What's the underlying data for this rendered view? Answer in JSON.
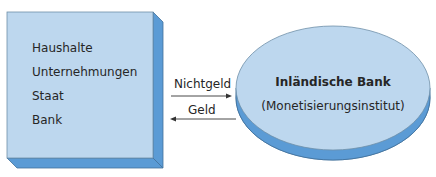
{
  "diagram": {
    "left_box": {
      "items": [
        "Haushalte",
        "Unternehmungen",
        "Staat",
        "Bank"
      ]
    },
    "arrows": [
      {
        "label": "Nichtgeld",
        "direction": "right"
      },
      {
        "label": "Geld",
        "direction": "left"
      }
    ],
    "right_ellipse": {
      "title": "Inländische Bank",
      "subtitle": "(Monetisierungsinstitut)"
    },
    "colors": {
      "face": "#bdd7ee",
      "extrusion": "#5b9bd5",
      "outline": "#41719c",
      "arrow": "#333333"
    }
  }
}
